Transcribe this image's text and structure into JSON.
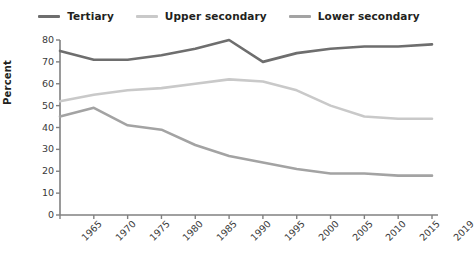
{
  "chart_data": {
    "type": "line",
    "title": "",
    "xlabel": "",
    "ylabel": "Percent",
    "categories": [
      "1965",
      "1970",
      "1975",
      "1980",
      "1985",
      "1990",
      "1995",
      "2000",
      "2005",
      "2010",
      "2015",
      "2019"
    ],
    "ylim": [
      0,
      80
    ],
    "yticks": [
      0,
      10,
      20,
      30,
      40,
      50,
      60,
      70,
      80
    ],
    "grid": false,
    "legend_position": "top-center",
    "series": [
      {
        "name": "Tertiary",
        "color": "#6e6e6e",
        "values": [
          75,
          71,
          71,
          73,
          76,
          80,
          70,
          74,
          76,
          77,
          77,
          78
        ]
      },
      {
        "name": "Upper secondary",
        "color": "#c9c9c9",
        "values": [
          52,
          55,
          57,
          58,
          60,
          62,
          61,
          57,
          50,
          45,
          44,
          44
        ]
      },
      {
        "name": "Lower secondary",
        "color": "#a3a3a3",
        "values": [
          45,
          49,
          41,
          39,
          32,
          27,
          24,
          21,
          19,
          19,
          18,
          18
        ]
      }
    ]
  },
  "legend": {
    "items": [
      {
        "label": "Tertiary",
        "color": "#6e6e6e"
      },
      {
        "label": "Upper secondary",
        "color": "#c9c9c9"
      },
      {
        "label": "Lower secondary",
        "color": "#a3a3a3"
      }
    ]
  },
  "axis": {
    "y_title": "Percent",
    "y_tick_labels": [
      "80",
      "70",
      "60",
      "50",
      "40",
      "30",
      "20",
      "10",
      "0"
    ],
    "x_tick_labels": [
      "1965",
      "1970",
      "1975",
      "1980",
      "1985",
      "1990",
      "1995",
      "2000",
      "2005",
      "2010",
      "2015",
      "2019"
    ]
  },
  "colors": {
    "axis": "#808080",
    "text": "#231f20",
    "tick_text": "#3a3a3a",
    "background": "#ffffff"
  }
}
